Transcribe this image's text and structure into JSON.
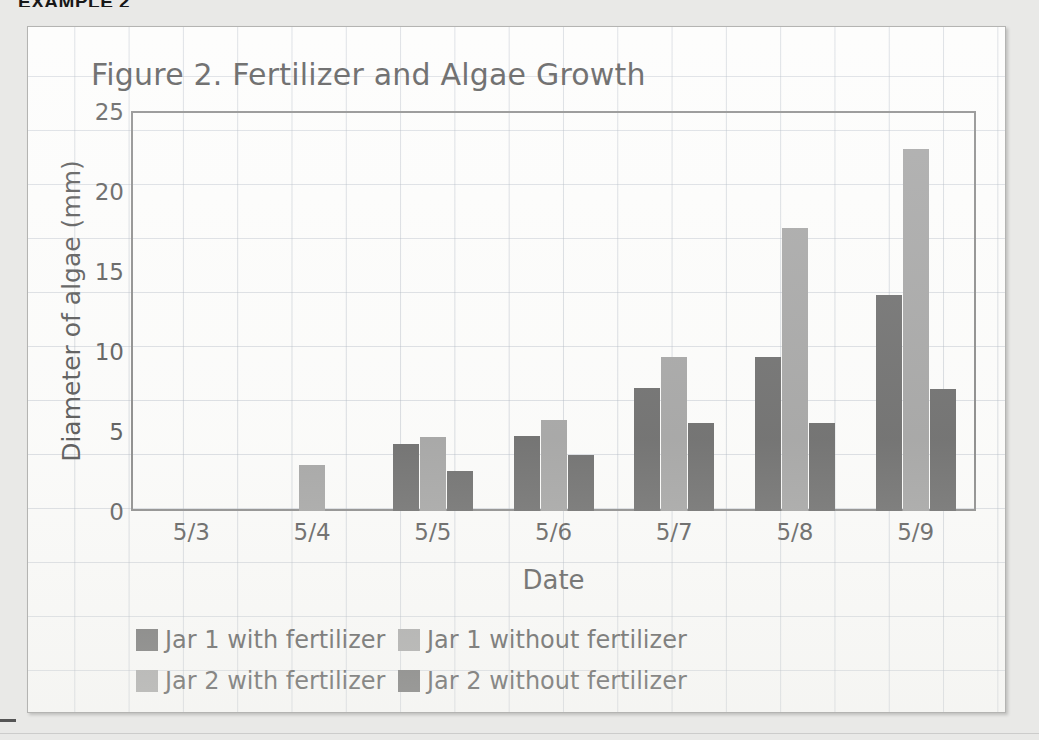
{
  "page": {
    "heading": "EXAMPLE 2"
  },
  "chart": {
    "title": "Figure 2. Fertilizer and Algae Growth",
    "xaxis_title": "Date",
    "yaxis_title": "Diameter of algae (mm)"
  },
  "legend": {
    "items": [
      {
        "label": "Jar 1 with fertilizer",
        "color": "#4a4a4a",
        "swatch_name": "legend-swatch-jar1-with"
      },
      {
        "label": "Jar 1 without fertilizer",
        "color": "#8f8f8f",
        "swatch_name": "legend-swatch-jar1-without"
      },
      {
        "label": "Jar 2 with fertilizer",
        "color": "#8f8f8f",
        "swatch_name": "legend-swatch-jar2-with"
      },
      {
        "label": "Jar 2 without fertilizer",
        "color": "#4a4a4a",
        "swatch_name": "legend-swatch-jar2-without"
      }
    ]
  },
  "chart_data": {
    "type": "bar",
    "title": "Figure 2. Fertilizer and Algae Growth",
    "xlabel": "Date",
    "ylabel": "Diameter of algae (mm)",
    "ylim": [
      0,
      25
    ],
    "yticks": [
      0,
      5,
      10,
      15,
      20,
      25
    ],
    "grid": true,
    "legend_position": "bottom-left",
    "categories": [
      "5/3",
      "5/4",
      "5/5",
      "5/6",
      "5/7",
      "5/8",
      "5/9"
    ],
    "series": [
      {
        "name": "Jar 1 with fertilizer",
        "color": "#4a4a4a",
        "values": [
          0,
          0,
          4.2,
          4.7,
          7.7,
          9.6,
          13.5
        ]
      },
      {
        "name": "Jar 1 without fertilizer",
        "color": "#8f8f8f",
        "values": [
          0,
          0,
          0,
          0,
          0,
          0,
          0
        ]
      },
      {
        "name": "Jar 2 with fertilizer",
        "color": "#8f8f8f",
        "values": [
          0,
          2.9,
          4.6,
          5.7,
          9.6,
          17.7,
          22.6
        ]
      },
      {
        "name": "Jar 2 without fertilizer",
        "color": "#4a4a4a",
        "values": [
          0,
          0,
          2.5,
          3.5,
          5.5,
          5.5,
          7.6
        ]
      }
    ]
  }
}
